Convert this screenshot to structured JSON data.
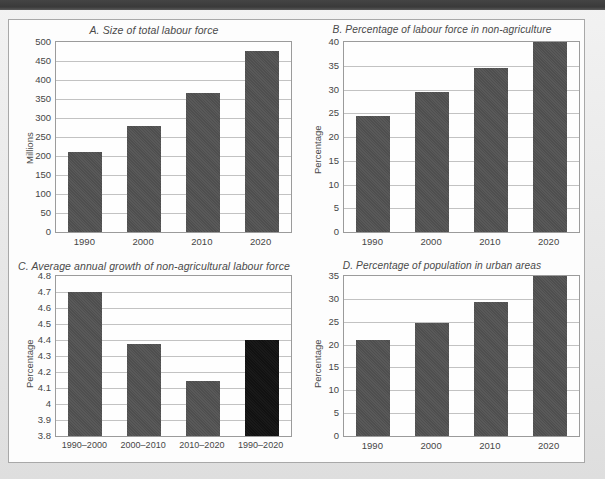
{
  "page": {
    "background_color": "#e9e9e9",
    "panel_color": "#fdfdfd",
    "top_band_color": "#3f3f3f",
    "bar_color": "#525252",
    "highlight_bar_color": "#121212",
    "gridline_color": "#c2c2c2",
    "axis_color": "#9b9b9b"
  },
  "chart_data": [
    {
      "id": "A",
      "type": "bar",
      "title": "A. Size of total labour force",
      "xlabel": "",
      "ylabel": "Millions",
      "categories": [
        "1990",
        "2000",
        "2010",
        "2020"
      ],
      "values": [
        210,
        280,
        365,
        477
      ],
      "ylim": [
        0,
        500
      ],
      "yticks": [
        0,
        50,
        100,
        150,
        200,
        250,
        300,
        350,
        400,
        450,
        500
      ],
      "ytick_labels": [
        "0",
        "50",
        "100",
        "150",
        "200",
        "250",
        "300",
        "350",
        "400",
        "450",
        "500"
      ],
      "grid": true,
      "legend": "none",
      "bar_colors": [
        "#525252",
        "#525252",
        "#525252",
        "#525252"
      ]
    },
    {
      "id": "B",
      "type": "bar",
      "title": "B. Percentage of labour force in non-agriculture",
      "xlabel": "",
      "ylabel": "Percentage",
      "categories": [
        "1990",
        "2000",
        "2010",
        "2020"
      ],
      "values": [
        24.4,
        29.5,
        34.5,
        40.0
      ],
      "ylim": [
        0,
        40
      ],
      "yticks": [
        0,
        5,
        10,
        15,
        20,
        25,
        30,
        35,
        40
      ],
      "ytick_labels": [
        "0",
        "5",
        "10",
        "15",
        "20",
        "25",
        "30",
        "35",
        "40"
      ],
      "grid": true,
      "legend": "none",
      "bar_colors": [
        "#525252",
        "#525252",
        "#525252",
        "#525252"
      ]
    },
    {
      "id": "C",
      "type": "bar",
      "title": "C. Average annual growth of non-agricultural labour force",
      "xlabel": "",
      "ylabel": "Percentage",
      "categories": [
        "1990–2000",
        "2000–2010",
        "2010–2020",
        "1990–2020"
      ],
      "values": [
        4.7,
        4.375,
        4.145,
        4.4
      ],
      "ylim": [
        3.8,
        4.8
      ],
      "yticks": [
        3.8,
        3.9,
        4.0,
        4.1,
        4.2,
        4.3,
        4.4,
        4.5,
        4.6,
        4.7,
        4.8
      ],
      "ytick_labels": [
        "3.8",
        "3.9",
        "4",
        "4.1",
        "4.2",
        "4.3",
        "4.4",
        "4.5",
        "4.6",
        "4.7",
        "4.8"
      ],
      "grid": true,
      "legend": "none",
      "bar_colors": [
        "#525252",
        "#525252",
        "#525252",
        "#121212"
      ]
    },
    {
      "id": "D",
      "type": "bar",
      "title": "D. Percentage of population in urban areas",
      "xlabel": "",
      "ylabel": "Percentage",
      "categories": [
        "1990",
        "2000",
        "2010",
        "2020"
      ],
      "values": [
        21.0,
        24.7,
        29.3,
        35.0
      ],
      "ylim": [
        0,
        35
      ],
      "yticks": [
        0,
        5,
        10,
        15,
        20,
        25,
        30,
        35
      ],
      "ytick_labels": [
        "0",
        "5",
        "10",
        "15",
        "20",
        "25",
        "30",
        "35"
      ],
      "grid": true,
      "legend": "none",
      "bar_colors": [
        "#525252",
        "#525252",
        "#525252",
        "#525252"
      ]
    }
  ]
}
